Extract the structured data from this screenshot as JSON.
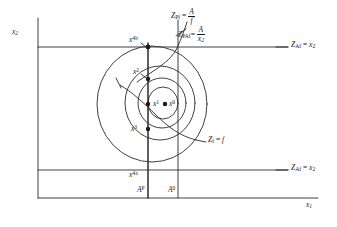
{
  "figure": {
    "type": "technical-diagram",
    "background": "#ffffff",
    "ink": "#1a1a1a",
    "axes": {
      "y_label": "x",
      "y_sub": "2",
      "x_label": "x",
      "x_sub": "1"
    },
    "annotations": {
      "z_pf": {
        "lhs": "Z",
        "lhs_sub": "Pf",
        "eq": "=",
        "num": "A",
        "den": "f"
      },
      "z_paf": {
        "lhs": "Z",
        "lhs_sub": "PAf",
        "eq": "=",
        "num": "A",
        "den": "x",
        "den_sub": "2"
      },
      "z_af_upper": {
        "lhs": "Z",
        "lhs_sub": "Af",
        "eq": "=",
        "rhs": "x",
        "rhs_sub": "2"
      },
      "z_af_lower": {
        "lhs": "Z",
        "lhs_sub": "Af",
        "eq": "=",
        "rhs": "x",
        "rhs_sub": "2"
      },
      "z_f": {
        "lhs": "Z",
        "lhs_sub": "f",
        "eq": "=",
        "rhs": "f"
      }
    },
    "points": [
      {
        "name": "x0",
        "base": "x",
        "sup": "0",
        "cx": 165,
        "cy": 104,
        "label_x": 168,
        "label_y": 101
      },
      {
        "name": "x1",
        "base": "x",
        "sup": "1",
        "cx": 148,
        "cy": 104,
        "label_x": 151,
        "label_y": 101
      },
      {
        "name": "x2",
        "base": "x",
        "sup": "2",
        "cx": 148,
        "cy": 79,
        "label_x": 133,
        "label_y": 72
      },
      {
        "name": "x3",
        "base": "x",
        "sup": "3",
        "cx": 148,
        "cy": 129,
        "label_x": 132,
        "label_y": 127
      },
      {
        "name": "x4b",
        "base": "x",
        "sup": "4b",
        "cx": 148,
        "cy": 47,
        "label_x": 129,
        "label_y": 40
      },
      {
        "name": "x4a",
        "base": "x",
        "sup": "4a",
        "cx": 148,
        "cy": 170,
        "label_x": 130,
        "label_y": 170
      }
    ],
    "vertical_lines": [
      {
        "name": "AP",
        "base": "A",
        "sup": "P",
        "x": 148,
        "label_x": 138,
        "label_y": 186
      },
      {
        "name": "A0",
        "base": "A",
        "sup": "0",
        "x": 178,
        "label_x": 169,
        "label_y": 186
      }
    ],
    "horizontal_lines": [
      {
        "name": "upper-constraint",
        "y": 47
      },
      {
        "name": "lower-constraint",
        "y": 170
      }
    ],
    "contours": [
      {
        "name": "outer-contour",
        "cx": 152,
        "cy": 104,
        "rx": 55,
        "ry": 58
      },
      {
        "name": "middle-contour",
        "cx": 160,
        "cy": 103,
        "rx": 35,
        "ry": 37
      },
      {
        "name": "inner-contour",
        "cx": 162,
        "cy": 103,
        "rx": 24,
        "ry": 25
      },
      {
        "name": "innermost-contour",
        "cx": 163,
        "cy": 103,
        "rx": 15,
        "ry": 16
      }
    ]
  }
}
